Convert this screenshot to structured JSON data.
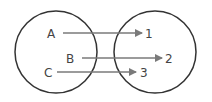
{
  "diagram": {
    "type": "mapping",
    "domain_set": {
      "name": "domain",
      "elements": [
        "A",
        "B",
        "C"
      ]
    },
    "codomain_set": {
      "name": "codomain",
      "elements": [
        "1",
        "2",
        "3"
      ]
    },
    "mappings": [
      {
        "from": "A",
        "to": "1"
      },
      {
        "from": "B",
        "to": "2"
      },
      {
        "from": "C",
        "to": "3"
      }
    ],
    "colors": {
      "circle": "#333333",
      "arrow": "#7a7a7a",
      "text": "#444444"
    }
  }
}
